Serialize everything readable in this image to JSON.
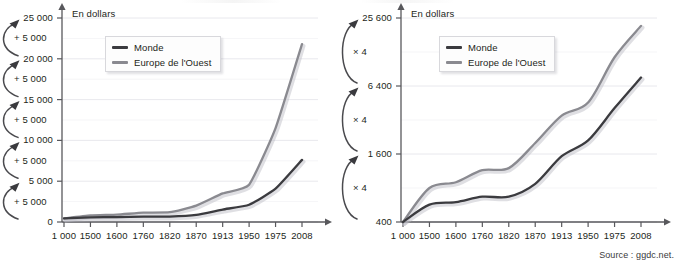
{
  "figure": {
    "source_note": "Source : ggdc.net.",
    "axis_caption": "En dollars",
    "colors": {
      "monde_line": "#3b3b3f",
      "europe_line": "#8a8a90",
      "grid": "#e2e2e8",
      "axis": "#58585c",
      "text": "#231f20"
    }
  },
  "legend": {
    "monde": "Monde",
    "europe": "Europe de l'Ouest"
  },
  "chart_data": [
    {
      "type": "line",
      "id": "linear-scale-chart",
      "title": "",
      "xlabel": "",
      "ylabel": "En dollars",
      "scale": "linear",
      "grid": true,
      "legend_position": "top-left",
      "x": [
        "1 000",
        "1500",
        "1600",
        "1760",
        "1820",
        "1870",
        "1913",
        "1950",
        "1975",
        "2008"
      ],
      "ylim": [
        0,
        25000
      ],
      "yticks": [
        0,
        5000,
        10000,
        15000,
        20000,
        25000
      ],
      "ytick_labels": [
        "0",
        "5 000",
        "10 000",
        "15 000",
        "20 000",
        "25 000"
      ],
      "step_annotations": [
        "+ 5 000",
        "+ 5 000",
        "+ 5 000",
        "+ 5 000",
        "+ 5 000"
      ],
      "series": [
        {
          "name": "Monde",
          "values": [
            450,
            570,
            600,
            670,
            670,
            870,
            1530,
            2110,
            4080,
            7610
          ]
        },
        {
          "name": "Europe de l'Ouest",
          "values": [
            425,
            800,
            900,
            1150,
            1200,
            2000,
            3500,
            4570,
            11500,
            21800
          ]
        }
      ]
    },
    {
      "type": "line",
      "id": "log-scale-chart",
      "title": "",
      "xlabel": "",
      "ylabel": "En dollars",
      "scale": "log4",
      "grid": true,
      "legend_position": "top-left",
      "x": [
        "1 000",
        "1500",
        "1600",
        "1760",
        "1820",
        "1870",
        "1913",
        "1950",
        "1975",
        "2008"
      ],
      "ylim": [
        400,
        25600
      ],
      "yticks": [
        400,
        1600,
        6400,
        25600
      ],
      "ytick_labels": [
        "400",
        "1 600",
        "6 400",
        "25 600"
      ],
      "step_annotations": [
        "× 4",
        "× 4",
        "× 4"
      ],
      "series": [
        {
          "name": "Monde",
          "values": [
            400,
            570,
            600,
            670,
            670,
            870,
            1530,
            2110,
            4080,
            7610
          ]
        },
        {
          "name": "Europe de l'Ouest",
          "values": [
            400,
            800,
            900,
            1150,
            1200,
            2000,
            3500,
            4570,
            11500,
            21800
          ]
        }
      ]
    }
  ]
}
